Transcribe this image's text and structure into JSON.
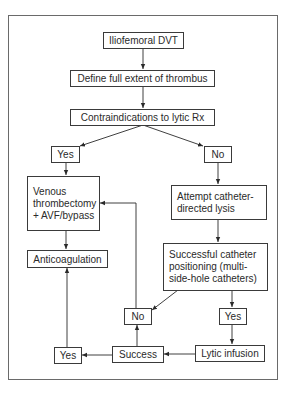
{
  "diagram": {
    "type": "flowchart",
    "nodes": {
      "start": "Iliofemoral DVT",
      "define": "Define full extent of thrombus",
      "contra": "Contraindications to lytic Rx",
      "yes_top": "Yes",
      "no_top": "No",
      "thrombectomy": "Venous\nthrombectomy\n+ AVF/bypass",
      "attempt_lysis": "Attempt catheter-\ndirected lysis",
      "anticoag": "Anticoagulation",
      "positioning": "Successful catheter\npositioning (multi-\nside-hole catheters)",
      "no_mid": "No",
      "yes_right": "Yes",
      "yes_bottom": "Yes",
      "success": "Success",
      "lytic": "Lytic infusion"
    },
    "edges": [
      [
        "start",
        "define"
      ],
      [
        "define",
        "contra"
      ],
      [
        "contra",
        "yes_top"
      ],
      [
        "contra",
        "no_top"
      ],
      [
        "yes_top",
        "thrombectomy"
      ],
      [
        "no_top",
        "attempt_lysis"
      ],
      [
        "thrombectomy",
        "anticoag"
      ],
      [
        "attempt_lysis",
        "positioning"
      ],
      [
        "positioning",
        "no_mid"
      ],
      [
        "positioning",
        "yes_right"
      ],
      [
        "yes_right",
        "lytic"
      ],
      [
        "lytic",
        "success"
      ],
      [
        "success",
        "no_mid"
      ],
      [
        "success",
        "yes_bottom"
      ],
      [
        "no_mid",
        "thrombectomy"
      ],
      [
        "yes_bottom",
        "anticoag"
      ]
    ],
    "colors": {
      "line": "#2a2a2a",
      "frame": "#6a6a6a",
      "background": "#ffffff"
    }
  }
}
